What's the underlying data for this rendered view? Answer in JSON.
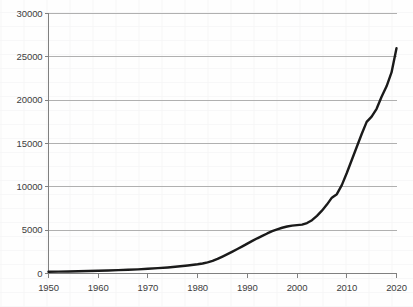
{
  "chart_data": {
    "type": "line",
    "title": "",
    "subtitle": "",
    "xlabel": "",
    "ylabel": "",
    "xlim": [
      1950,
      2020
    ],
    "ylim": [
      0,
      30000
    ],
    "grid": true,
    "grid_axis": "y",
    "legend": false,
    "legend_position": "none",
    "line_color": "#1a1a1a",
    "grid_color": "#b0b0b0",
    "axis_color": "#808080",
    "background_color": "#ffffff",
    "xticks": [
      1950,
      1960,
      1970,
      1980,
      1990,
      2000,
      2010,
      2020
    ],
    "xtick_labels": [
      "1950",
      "1960",
      "1970",
      "1980",
      "1990",
      "2000",
      "2010",
      "2020"
    ],
    "yticks": [
      0,
      5000,
      10000,
      15000,
      20000,
      25000,
      30000
    ],
    "ytick_labels": [
      "0",
      "5000",
      "10000",
      "15000",
      "20000",
      "25000",
      "30000"
    ],
    "series": [
      {
        "name": "cumulative-total",
        "x": [
          1950,
          1952,
          1954,
          1956,
          1958,
          1960,
          1962,
          1964,
          1966,
          1968,
          1970,
          1972,
          1974,
          1976,
          1978,
          1980,
          1981,
          1982,
          1983,
          1984,
          1985,
          1986,
          1987,
          1988,
          1989,
          1990,
          1991,
          1992,
          1993,
          1994,
          1995,
          1996,
          1997,
          1998,
          1999,
          2000,
          2001,
          2002,
          2003,
          2004,
          2005,
          2006,
          2007,
          2008,
          2009,
          2010,
          2011,
          2012,
          2013,
          2014,
          2015,
          2016,
          2017,
          2018,
          2019,
          2020
        ],
        "y": [
          200,
          215,
          235,
          255,
          280,
          310,
          345,
          385,
          430,
          480,
          545,
          620,
          700,
          800,
          920,
          1060,
          1150,
          1280,
          1450,
          1680,
          1950,
          2230,
          2520,
          2820,
          3130,
          3450,
          3760,
          4060,
          4340,
          4620,
          4880,
          5100,
          5280,
          5420,
          5520,
          5580,
          5640,
          5820,
          6150,
          6650,
          7250,
          7950,
          8750,
          9150,
          10200,
          11600,
          13100,
          14600,
          16100,
          17500,
          18100,
          19000,
          20400,
          21600,
          23200,
          26000
        ]
      }
    ]
  }
}
